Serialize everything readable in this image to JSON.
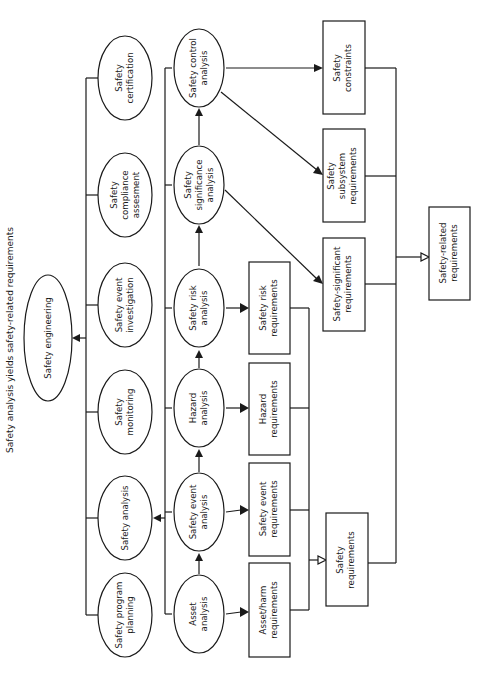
{
  "title": "Safety analysis yields safety-related requirements",
  "root": {
    "line1": "Safety engineering"
  },
  "activities": [
    {
      "id": "certification",
      "lines": [
        "Safety",
        "certification"
      ]
    },
    {
      "id": "compliance",
      "lines": [
        "Safety",
        "compliance",
        "assesment"
      ]
    },
    {
      "id": "event-investigation",
      "lines": [
        "Safety event",
        "investigation"
      ]
    },
    {
      "id": "monitoring",
      "lines": [
        "Safety",
        "monitoring"
      ]
    },
    {
      "id": "safety-analysis",
      "lines": [
        "Safety analysis"
      ]
    },
    {
      "id": "program-planning",
      "lines": [
        "Safety program",
        "planning"
      ]
    }
  ],
  "analyses": [
    {
      "id": "control",
      "lines": [
        "Safety control",
        "analysis"
      ]
    },
    {
      "id": "significance",
      "lines": [
        "Safety",
        "significance",
        "analysis"
      ]
    },
    {
      "id": "risk",
      "lines": [
        "Safety risk",
        "analysis"
      ]
    },
    {
      "id": "hazard",
      "lines": [
        "Hazard",
        "analysis"
      ]
    },
    {
      "id": "event",
      "lines": [
        "Safety event",
        "analysis"
      ]
    },
    {
      "id": "asset",
      "lines": [
        "Asset",
        "analysis"
      ]
    }
  ],
  "requirements": [
    {
      "id": "risk-req",
      "lines": [
        "Safety risk",
        "requirements"
      ]
    },
    {
      "id": "hazard-req",
      "lines": [
        "Hazard",
        "requirements"
      ]
    },
    {
      "id": "event-req",
      "lines": [
        "Safety event",
        "requirements"
      ]
    },
    {
      "id": "asset-harm-req",
      "lines": [
        "Asset/harm",
        "requirements"
      ]
    }
  ],
  "safety_requirements": {
    "lines": [
      "Safety",
      "requirements"
    ]
  },
  "outputs": [
    {
      "id": "constraints",
      "lines": [
        "Safety",
        "constraints"
      ]
    },
    {
      "id": "subsystem",
      "lines": [
        "Safety",
        "subsystem",
        "requirements"
      ]
    },
    {
      "id": "significant",
      "lines": [
        "Safety-significant",
        "requirements"
      ]
    }
  ],
  "safety_related": {
    "lines": [
      "Safety-related",
      "requirements"
    ]
  }
}
